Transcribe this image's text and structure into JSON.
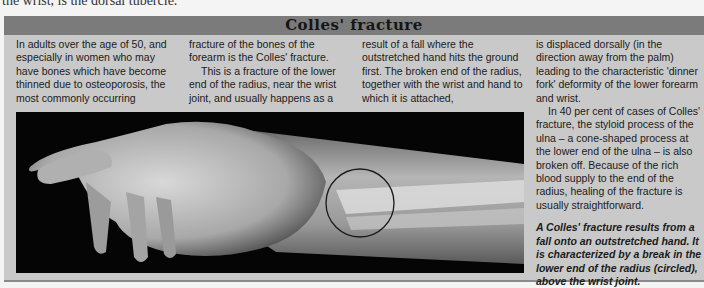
{
  "top_caption": "the wrist, is the dorsal tubercle.",
  "panel": {
    "title": "Colles' fracture",
    "columns": [
      {
        "paragraphs": [
          "In adults over the age of 50, and especially in women who may have bones which have become thinned due to osteoporosis, the most commonly occurring"
        ]
      },
      {
        "paragraphs": [
          "fracture of the bones of the forearm is the Colles' fracture.",
          "This is a fracture of the lower end of the radius, near the wrist joint, and usually happens as a"
        ]
      },
      {
        "paragraphs": [
          "result of a fall where the outstretched hand hits the ground first. The broken end of the radius, together with the wrist and hand to which it is attached,"
        ]
      },
      {
        "paragraphs": [
          "is displaced dorsally (in the direction away from the palm) leading to the characteristic 'dinner fork' deformity of the lower forearm and wrist.",
          "In 40 per cent of cases of Colles' fracture, the styloid process of the ulna – a cone-shaped process at the lower end of the ulna – is also broken off. Because of the rich blood supply to the end of the radius, healing of the fracture is usually straightforward."
        ],
        "caption": "A Colles' fracture results from a fall onto an outstretched hand. It is characterized by a break in the lower end of the radius (circled), above the wrist joint."
      }
    ],
    "image": {
      "subject": "X-ray of hand and forearm showing Colles' fracture",
      "annotation": "circle around fracture of lower radius"
    }
  }
}
